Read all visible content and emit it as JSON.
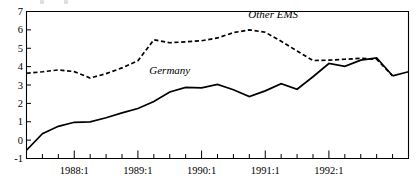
{
  "chart_data": {
    "type": "line",
    "title": "",
    "subtitle": "",
    "xlabel": "",
    "ylabel": "",
    "xlim": [
      0,
      23
    ],
    "ylim": [
      -1,
      7
    ],
    "yticks": [
      -1,
      0,
      1,
      2,
      3,
      4,
      5,
      6,
      7
    ],
    "ytick_labels": [
      "-1",
      "0",
      "1",
      "2",
      "3",
      "4",
      "5",
      "6",
      "7"
    ],
    "grid": false,
    "legend_position": "inline-annotations",
    "x": [
      "1987:2",
      "1987:3",
      "1987:4",
      "1988:1",
      "1988:2",
      "1988:3",
      "1988:4",
      "1989:1",
      "1989:2",
      "1989:3",
      "1989:4",
      "1990:1",
      "1990:2",
      "1990:3",
      "1990:4",
      "1991:1",
      "1991:2",
      "1991:3",
      "1991:4",
      "1992:1",
      "1992:2",
      "1992:3",
      "1992:4",
      "1993:1"
    ],
    "xtick_labels": [
      "1988:1",
      "1989:1",
      "1990:1",
      "1991:1",
      "1992:1"
    ],
    "xtick_label_positions": [
      3,
      7,
      11,
      15,
      19
    ],
    "minor_ticks_per_year": 4,
    "series": [
      {
        "name": "Germany",
        "style": "solid",
        "annotation": "Germany",
        "annotation_x": 9.0,
        "annotation_y": 3.62,
        "values": [
          -0.55,
          0.35,
          0.75,
          0.97,
          0.99,
          1.22,
          1.48,
          1.72,
          2.1,
          2.62,
          2.87,
          2.84,
          3.03,
          2.74,
          2.37,
          2.68,
          3.07,
          2.77,
          3.45,
          4.17,
          4.02,
          4.35,
          4.48,
          3.5
        ]
      },
      {
        "name": "Other EMS",
        "style": "dashed",
        "annotation": "Other EMS",
        "annotation_x": 15.5,
        "annotation_y": 6.62,
        "values": [
          3.64,
          3.72,
          3.82,
          3.73,
          3.38,
          3.62,
          3.93,
          4.32,
          5.46,
          5.3,
          5.35,
          5.41,
          5.56,
          5.85,
          6.0,
          5.87,
          5.38,
          4.85,
          4.33,
          4.35,
          4.4,
          4.45,
          4.4,
          3.5
        ]
      }
    ],
    "series_tail": {
      "name": "Germany",
      "final_values": [
        3.5,
        3.72
      ],
      "final_x": [
        "1993:1",
        "1993:2"
      ]
    }
  },
  "axis": {
    "y_min_label": "-1",
    "y_max_label": "7"
  }
}
